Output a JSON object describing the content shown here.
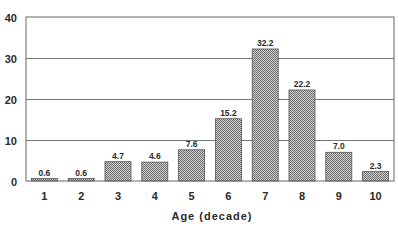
{
  "chart_data": {
    "type": "bar",
    "title": "",
    "xlabel": "Age (decade)",
    "ylabel": "",
    "categories": [
      "1",
      "2",
      "3",
      "4",
      "5",
      "6",
      "7",
      "8",
      "9",
      "10"
    ],
    "values": [
      0.6,
      0.6,
      4.7,
      4.6,
      7.6,
      15.2,
      32.2,
      22.2,
      7.0,
      2.3
    ],
    "value_labels": [
      "0.6",
      "0.6",
      "4.7",
      "4.6",
      "7.6",
      "15.2",
      "32.2",
      "22.2",
      "7.0",
      "2.3"
    ],
    "ylim": [
      0,
      40
    ],
    "yticks": [
      0,
      10,
      20,
      30,
      40
    ],
    "grid": true,
    "legend": null,
    "bar_fill": "crosshatch gray",
    "colors": {
      "bar": "#9a9a9a",
      "bar_edge": "#555555",
      "grid": "#777777",
      "axis": "#555555"
    }
  }
}
